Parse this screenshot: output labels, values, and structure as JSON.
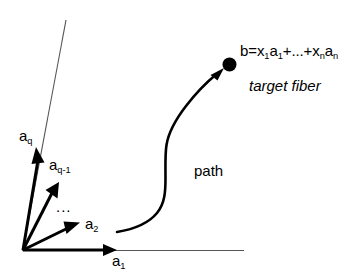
{
  "figure": {
    "background_color": "#ffffff",
    "stroke_color": "#000000",
    "thin_line_color": "#444444"
  },
  "axes": {
    "horizontal_axis_name": "a1-axis",
    "span_line_name": "aq-span-line"
  },
  "vectors": [
    {
      "name": "a-q",
      "label_base": "a",
      "label_sub": "q",
      "label_full": "a_q"
    },
    {
      "name": "a-q-minus-1",
      "label_base": "a",
      "label_sub": "q-1",
      "label_full": "a_q-1"
    },
    {
      "name": "a-2",
      "label_base": "a",
      "label_sub": "2",
      "label_full": "a_2"
    },
    {
      "name": "a-1",
      "label_base": "a",
      "label_sub": "1",
      "label_full": "a_1"
    }
  ],
  "labels": {
    "ellipsis": "...",
    "path": "path",
    "target_fiber": "target fiber"
  },
  "formula": {
    "lhs": "b=x",
    "sub1": "1",
    "mid1": "a",
    "sub2": "1",
    "mid2": "+...+x",
    "sub3": "n",
    "mid3": "a",
    "sub4": "n",
    "full_text": "b=x1a1+...+xnan"
  }
}
